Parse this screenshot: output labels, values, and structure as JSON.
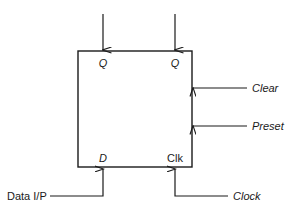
{
  "diagram": {
    "type": "logic-block-diagram",
    "colors": {
      "background": "#ffffff",
      "stroke": "#1a1a1a",
      "text": "#1a1a1a"
    },
    "block": {
      "name": "flip-flop-block",
      "x": 78,
      "y": 51,
      "width": 114,
      "height": 116
    },
    "outputs": [
      {
        "id": "q",
        "label": "Q",
        "style": "italic",
        "edge": "top",
        "x": 103,
        "arrow": "down"
      },
      {
        "id": "q-bar",
        "label": "Q",
        "style": "italic",
        "edge": "top",
        "x": 175,
        "arrow": "down"
      }
    ],
    "control_inputs": [
      {
        "id": "clear",
        "label": "Clear",
        "style": "italic",
        "edge": "right",
        "y": 88,
        "arrow": "left"
      },
      {
        "id": "preset",
        "label": "Preset",
        "style": "italic",
        "edge": "right",
        "y": 126,
        "arrow": "left"
      }
    ],
    "bottom_pins": [
      {
        "id": "d",
        "label": "D",
        "style": "italic",
        "edge": "bottom",
        "x": 103,
        "arrow": "up",
        "source_label": "Data I/P",
        "source_style": "upright",
        "source_side": "left"
      },
      {
        "id": "clk",
        "label": "Clk",
        "style": "upright",
        "edge": "bottom",
        "x": 175,
        "arrow": "up",
        "source_label": "Clock",
        "source_style": "italic",
        "source_side": "right"
      }
    ]
  }
}
